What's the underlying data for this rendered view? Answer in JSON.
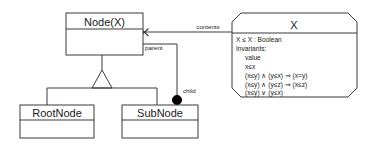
{
  "diagram": {
    "type": "uml-class-diagram",
    "background_color": "#ffffff",
    "line_color": "#3b3b3b",
    "text_color": "#1a1a1a",
    "classes": [
      {
        "id": "node-x",
        "name": "Node(X)",
        "kind": "parameterized-class"
      },
      {
        "id": "rootnode",
        "name": "RootNode",
        "kind": "class"
      },
      {
        "id": "subnode",
        "name": "SubNode",
        "kind": "class"
      }
    ],
    "parameter_box": {
      "id": "param-x",
      "name": "X",
      "shape": "octagon",
      "signature": "X ≤ X : Boolean",
      "invariants_label": "Invariants:",
      "invariants": [
        "value",
        "x≤x",
        "(x≤y) ∧ (y≤x) ⇒ (x=y)",
        "(x≤y) ∧ (y≤z) ⇒ (x≤z)",
        "(x≤y) ∨ (y≤x)"
      ]
    },
    "association_labels": {
      "contents": "contents",
      "parent": "parent",
      "child": "child"
    },
    "markers": {
      "x_mark": "x-crossing-mark",
      "composition_dot": "filled-diamond-dot",
      "generalization": "hollow-triangle"
    }
  }
}
